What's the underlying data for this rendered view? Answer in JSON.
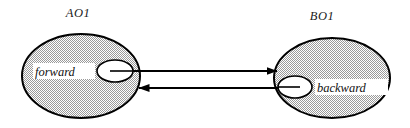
{
  "diagram": {
    "background_color": "#ffffff",
    "stroke_color": "#000000",
    "node_fill_pattern": "50-percent-checkerboard-dither",
    "node_fill_color": "#c9c9c9",
    "port_fill_color": "#ffffff",
    "nodes": [
      {
        "id": "A",
        "title": "AO1",
        "port_label": "forward",
        "title_x": 78,
        "title_y": 17,
        "ellipse": {
          "cx": 81,
          "cy": 76,
          "rx": 59,
          "ry": 42
        },
        "port_ellipse": {
          "cx": 115,
          "cy": 71,
          "rx": 18,
          "ry": 11
        },
        "port_label_x": 63,
        "port_label_y": 75
      },
      {
        "id": "B",
        "title": "BO1",
        "port_label": "backward",
        "title_x": 320,
        "title_y": 20,
        "ellipse": {
          "cx": 332,
          "cy": 78,
          "rx": 58,
          "ry": 40
        },
        "port_ellipse": {
          "cx": 295,
          "cy": 87,
          "rx": 17,
          "ry": 11
        },
        "port_label_x": 355,
        "port_label_y": 91
      }
    ],
    "arrows": [
      {
        "name": "forward-arrow",
        "direction": "right",
        "from_x": 115,
        "to_x": 278,
        "y": 71,
        "source_node": "A",
        "target_node": "B"
      },
      {
        "name": "backward-arrow",
        "direction": "left",
        "from_x": 295,
        "to_x": 138,
        "y": 88,
        "source_node": "B",
        "target_node": "A"
      }
    ]
  }
}
